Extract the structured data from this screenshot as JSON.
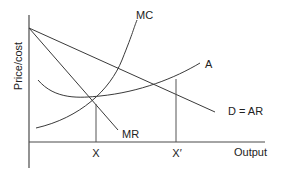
{
  "diagram": {
    "type": "economics-monopoly-cost-revenue",
    "y_axis_label": "Price/cost",
    "x_axis_label": "Output",
    "curves": {
      "mc_label": "MC",
      "ac_label": "A",
      "demand_label": "D = AR",
      "mr_label": "MR"
    },
    "x_markers": {
      "x_label": "X",
      "x_prime_label": "X′"
    },
    "colors": {
      "background": "#ffffff",
      "lines": "#3a3a3a",
      "text": "#222222"
    }
  }
}
